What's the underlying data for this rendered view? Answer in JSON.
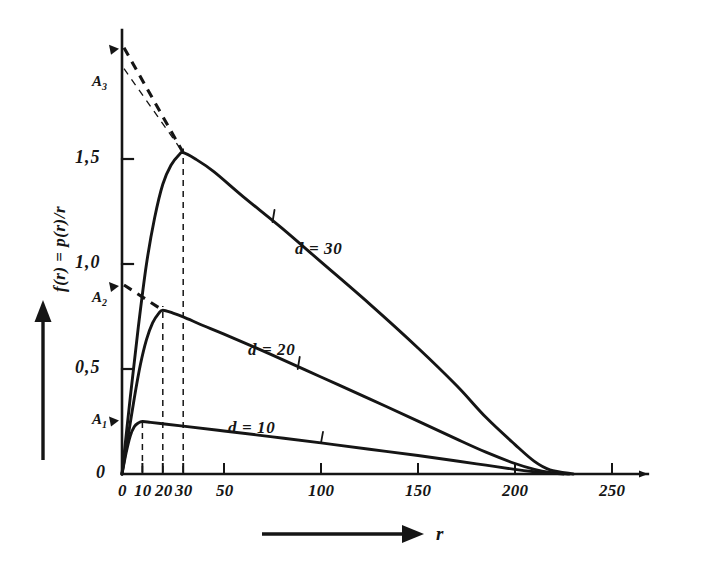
{
  "figure": {
    "title": "",
    "background_color": "#ffffff",
    "ink_color": "#151515",
    "axes": {
      "x_label": "r",
      "x_arrow_icon": "right-arrow-icon",
      "y_label": "f(r) = p(r)/r",
      "y_arrow_icon": "up-arrow-icon"
    }
  },
  "chart_data": {
    "type": "line",
    "title": "",
    "xlabel": "r",
    "ylabel": "f(r) = p(r)/r",
    "xlim": [
      0,
      262
    ],
    "ylim": [
      0,
      2.28
    ],
    "grid": false,
    "legend": "inline-curve-labels",
    "x_ticks": [
      0,
      10,
      20,
      30,
      50,
      100,
      150,
      200,
      250
    ],
    "x_tick_labels": [
      "0",
      "10",
      "20",
      "30",
      "50",
      "100",
      "150",
      "200",
      "250"
    ],
    "y_ticks": [
      0,
      0.5,
      1.0,
      1.5
    ],
    "y_tick_labels": [
      "0",
      "0,5",
      "1,0",
      "1,5"
    ],
    "series": [
      {
        "name": "d = 10",
        "label": "d = 10",
        "d": 10,
        "peak_r": 10,
        "peak_value": 0.25,
        "points": [
          [
            0,
            0.0
          ],
          [
            2,
            0.1
          ],
          [
            4,
            0.18
          ],
          [
            6,
            0.225
          ],
          [
            8,
            0.243
          ],
          [
            10,
            0.25
          ],
          [
            14,
            0.246
          ],
          [
            20,
            0.239
          ],
          [
            30,
            0.228
          ],
          [
            50,
            0.205
          ],
          [
            75,
            0.177
          ],
          [
            100,
            0.148
          ],
          [
            125,
            0.118
          ],
          [
            150,
            0.088
          ],
          [
            170,
            0.062
          ],
          [
            185,
            0.042
          ],
          [
            200,
            0.022
          ],
          [
            210,
            0.011
          ],
          [
            218,
            0.004
          ],
          [
            225,
            0.0
          ]
        ]
      },
      {
        "name": "d = 20",
        "label": "d = 20",
        "d": 20,
        "peak_r": 20,
        "peak_value": 0.78,
        "points": [
          [
            0,
            0.0
          ],
          [
            3,
            0.18
          ],
          [
            6,
            0.36
          ],
          [
            9,
            0.52
          ],
          [
            12,
            0.64
          ],
          [
            15,
            0.72
          ],
          [
            18,
            0.765
          ],
          [
            20,
            0.78
          ],
          [
            25,
            0.766
          ],
          [
            30,
            0.748
          ],
          [
            40,
            0.706
          ],
          [
            50,
            0.666
          ],
          [
            75,
            0.566
          ],
          [
            100,
            0.462
          ],
          [
            125,
            0.358
          ],
          [
            150,
            0.252
          ],
          [
            170,
            0.166
          ],
          [
            185,
            0.104
          ],
          [
            200,
            0.05
          ],
          [
            210,
            0.022
          ],
          [
            218,
            0.008
          ],
          [
            228,
            0.0
          ]
        ]
      },
      {
        "name": "d = 30",
        "label": "d = 30",
        "d": 30,
        "peak_r": 30,
        "peak_value": 1.53,
        "points": [
          [
            0,
            0.0
          ],
          [
            4,
            0.36
          ],
          [
            8,
            0.7
          ],
          [
            12,
            1.0
          ],
          [
            16,
            1.22
          ],
          [
            20,
            1.38
          ],
          [
            24,
            1.47
          ],
          [
            28,
            1.52
          ],
          [
            30,
            1.53
          ],
          [
            36,
            1.5
          ],
          [
            45,
            1.44
          ],
          [
            60,
            1.32
          ],
          [
            80,
            1.17
          ],
          [
            100,
            1.01
          ],
          [
            125,
            0.81
          ],
          [
            150,
            0.6
          ],
          [
            170,
            0.42
          ],
          [
            185,
            0.27
          ],
          [
            200,
            0.14
          ],
          [
            210,
            0.06
          ],
          [
            218,
            0.02
          ],
          [
            230,
            0.0
          ]
        ]
      }
    ],
    "asymptote_markers": [
      {
        "name": "A1",
        "label": "A",
        "subscript": "1",
        "y_value": 0.26,
        "for_series": "d = 10"
      },
      {
        "name": "A2",
        "label": "A",
        "subscript": "2",
        "y_value": 0.9,
        "for_series": "d = 20"
      },
      {
        "name": "A3",
        "label": "A",
        "subscript": "3",
        "y_value": 2.03,
        "for_series": "d = 30"
      }
    ],
    "dashed_verticals": [
      {
        "r": 10,
        "to_value": 0.26
      },
      {
        "r": 20,
        "to_value": 0.8
      },
      {
        "r": 30,
        "to_value": 1.55
      }
    ],
    "dashed_tangents": [
      {
        "from": "A3",
        "from_value": 2.03,
        "to_r": 30,
        "to_value": 1.53,
        "style": "thick-dashed"
      },
      {
        "from": "A3_lower",
        "from_value": 1.93,
        "to_r": 30,
        "to_value": 1.53,
        "style": "thin-dashed"
      },
      {
        "from": "A2",
        "from_value": 0.9,
        "to_r": 20,
        "to_value": 0.78,
        "style": "thick-dashed"
      }
    ]
  }
}
